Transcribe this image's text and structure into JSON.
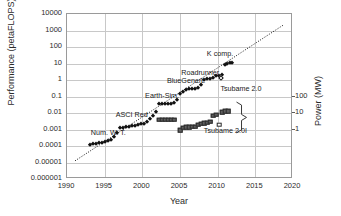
{
  "chart_data": {
    "type": "scatter",
    "title": "",
    "xlabel": "Year",
    "ylabel": "Performance (petaFLOPS)",
    "ylabel_right": "Power (MW)",
    "xlim": [
      1990,
      2020
    ],
    "ylim": [
      1e-06,
      10000
    ],
    "ylim_right": [
      0.1,
      1000
    ],
    "grid": true,
    "legend": "none",
    "xticks": [
      "1990",
      "1995",
      "2000",
      "2005",
      "2010",
      "2015",
      "2020"
    ],
    "yticks": [
      "10000",
      "1000",
      "100",
      "10",
      "1",
      "0.1",
      "0.01",
      "0.001",
      "0.0001",
      "0.00001",
      "0.000001"
    ],
    "yticks_right": [
      "100",
      "10",
      "1"
    ],
    "series": [
      {
        "name": "Performance",
        "marker": "filled-diamond",
        "axis": "left",
        "points": [
          [
            1993.0,
            0.00012
          ],
          [
            1993.4,
            0.00013
          ],
          [
            1993.8,
            0.00014
          ],
          [
            1994.2,
            0.00015
          ],
          [
            1994.6,
            0.00016
          ],
          [
            1995.0,
            0.00017
          ],
          [
            1995.4,
            0.0002
          ],
          [
            1995.8,
            0.00024
          ],
          [
            1996.2,
            0.00035
          ],
          [
            1996.6,
            0.0006
          ],
          [
            1997.0,
            0.0012
          ],
          [
            1997.4,
            0.0013
          ],
          [
            1997.8,
            0.0014
          ],
          [
            1998.2,
            0.0015
          ],
          [
            1998.6,
            0.0016
          ],
          [
            1999.0,
            0.0017
          ],
          [
            1999.4,
            0.0019
          ],
          [
            1999.8,
            0.0021
          ],
          [
            2000.2,
            0.0023
          ],
          [
            2000.6,
            0.003
          ],
          [
            2001.0,
            0.0045
          ],
          [
            2001.4,
            0.007
          ],
          [
            2001.8,
            0.012
          ],
          [
            2002.2,
            0.035
          ],
          [
            2002.6,
            0.036
          ],
          [
            2003.0,
            0.0365
          ],
          [
            2003.4,
            0.037
          ],
          [
            2003.8,
            0.0375
          ],
          [
            2004.2,
            0.038
          ],
          [
            2004.6,
            0.06
          ],
          [
            2005.0,
            0.14
          ],
          [
            2005.4,
            0.2
          ],
          [
            2005.8,
            0.26
          ],
          [
            2006.2,
            0.28
          ],
          [
            2006.6,
            0.29
          ],
          [
            2007.0,
            0.3
          ],
          [
            2007.4,
            0.31
          ],
          [
            2007.8,
            0.48
          ],
          [
            2008.2,
            1.05
          ],
          [
            2008.6,
            1.1
          ],
          [
            2009.0,
            1.2
          ],
          [
            2009.4,
            1.4
          ],
          [
            2009.8,
            1.7
          ],
          [
            2010.2,
            1.8
          ],
          [
            2010.6,
            2.0
          ],
          [
            2011.0,
            8.0
          ],
          [
            2011.3,
            9.0
          ],
          [
            2011.6,
            10.5
          ],
          [
            2011.9,
            11.0
          ]
        ]
      },
      {
        "name": "Performance (open marker)",
        "marker": "open-diamond",
        "axis": "left",
        "points": [
          [
            2010.5,
            1.4
          ]
        ]
      },
      {
        "name": "Power",
        "marker": "filled-square",
        "axis": "right",
        "points": [
          [
            2002.2,
            0.004
          ],
          [
            2002.6,
            0.004
          ],
          [
            2003.0,
            0.004
          ],
          [
            2003.4,
            0.004
          ],
          [
            2003.8,
            0.004
          ],
          [
            2004.2,
            0.004
          ],
          [
            2005.0,
            0.0009
          ],
          [
            2005.4,
            0.0013
          ],
          [
            2005.8,
            0.00135
          ],
          [
            2006.2,
            0.0014
          ],
          [
            2006.6,
            0.00145
          ],
          [
            2007.0,
            0.0015
          ],
          [
            2007.4,
            0.002
          ],
          [
            2007.8,
            0.0023
          ],
          [
            2008.2,
            0.0025
          ],
          [
            2008.6,
            0.0026
          ],
          [
            2009.0,
            0.003
          ],
          [
            2009.4,
            0.007
          ],
          [
            2009.8,
            0.008
          ],
          [
            2010.6,
            0.011
          ],
          [
            2011.0,
            0.0125
          ],
          [
            2011.4,
            0.013
          ]
        ]
      },
      {
        "name": "Power (open marker)",
        "marker": "open-square",
        "axis": "right",
        "points": [
          [
            2010.2,
            0.0019
          ]
        ]
      }
    ],
    "trendline": {
      "style": "dotted",
      "from": [
        1991.2,
        1.1e-05
      ],
      "to": [
        2018.8,
        1800
      ]
    },
    "annotations": [
      {
        "text": "Num. W. T.",
        "x": 1993.3,
        "y": 0.00062
      },
      {
        "text": "ASCI Red",
        "x": 1996.6,
        "y": 0.0075
      },
      {
        "text": "Earth-Sim.",
        "x": 2000.5,
        "y": 0.105
      },
      {
        "text": "BlueGene/L",
        "x": 2003.4,
        "y": 0.82
      },
      {
        "text": "Roadrunner",
        "x": 2005.3,
        "y": 2.6
      },
      {
        "text": "K comp.",
        "x": 2008.7,
        "y": 38.0
      },
      {
        "text": "Tsubame 2.0",
        "x": 2010.5,
        "y": 0.3
      },
      {
        "text": "Tsubame 2.0I",
        "x": 2008.3,
        "y": 0.00085
      }
    ]
  }
}
